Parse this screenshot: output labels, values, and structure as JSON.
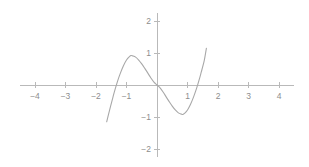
{
  "chart_data": {
    "type": "line",
    "title": "",
    "subtitle": "",
    "xlabel": "",
    "ylabel": "",
    "xlim": [
      -4.5,
      4.5
    ],
    "ylim": [
      -2.4,
      2.4
    ],
    "grid": false,
    "legend": null,
    "axes_style": "centered-cartesian",
    "background_color": "#ffffff",
    "axis_color": "#b9b9b9",
    "curve_color": "#a8a8a8",
    "label_color": "#8d8d8d",
    "xticks": [
      -4,
      -3,
      -2,
      -1,
      1,
      2,
      3,
      4
    ],
    "xtick_labels": [
      "-4",
      "-3",
      "-2",
      "-1",
      "",
      "1",
      "2",
      "3",
      "4"
    ],
    "yticks": [
      -2,
      -1,
      1,
      2
    ],
    "ytick_labels": [
      "2",
      "1",
      "-1",
      "-2"
    ],
    "x_axis_range_drawn": [
      -4.5,
      4.5
    ],
    "y_axis_range_drawn": [
      -2.25,
      2.25
    ],
    "series": [
      {
        "name": "cubic",
        "x_domain": [
          -1.65,
          1.62
        ],
        "roots": [
          -1.4,
          0,
          1.4
        ],
        "local_maximum": {
          "x": -0.85,
          "y": 0.92
        },
        "local_minimum": {
          "x": 0.85,
          "y": -1.25
        },
        "endpoint_left": {
          "x": -1.65,
          "y": -1.15
        },
        "endpoint_right": {
          "x": 1.62,
          "y": 1.3
        },
        "x": [
          -1.65,
          -1.55,
          -1.45,
          -1.4,
          -1.3,
          -1.2,
          -1.1,
          -1.0,
          -0.9,
          -0.85,
          -0.8,
          -0.7,
          -0.6,
          -0.5,
          -0.4,
          -0.3,
          -0.2,
          -0.1,
          0,
          0.1,
          0.2,
          0.3,
          0.4,
          0.5,
          0.6,
          0.7,
          0.8,
          0.85,
          0.9,
          1.0,
          1.1,
          1.2,
          1.3,
          1.4,
          1.45,
          1.55,
          1.62
        ],
        "values": [
          -1.15,
          -0.77,
          -0.4,
          -0.22,
          0.1,
          0.37,
          0.6,
          0.78,
          0.89,
          0.92,
          0.91,
          0.87,
          0.78,
          0.66,
          0.52,
          0.37,
          0.22,
          0.09,
          0.0,
          -0.09,
          -0.22,
          -0.37,
          -0.52,
          -0.66,
          -0.78,
          -0.87,
          -0.91,
          -0.92,
          -0.89,
          -0.78,
          -0.6,
          -0.37,
          -0.1,
          0.22,
          0.4,
          0.77,
          1.15
        ]
      }
    ]
  },
  "geometry": {
    "origin_px": {
      "x": 157,
      "y": 85
    },
    "x_unit_px": 30.5,
    "y_unit_px": 32,
    "tick_half_len_px": 3
  }
}
